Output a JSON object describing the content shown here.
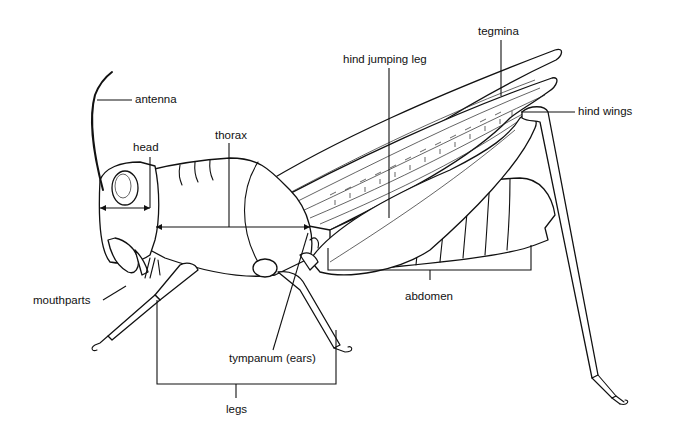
{
  "diagram": {
    "labels": {
      "antenna": "antenna",
      "head": "head",
      "thorax": "thorax",
      "hind_jumping_leg": "hind jumping leg",
      "tegmina": "tegmina",
      "hind_wings": "hind wings",
      "mouthparts": "mouthparts",
      "abdomen": "abdomen",
      "tympanum": "tympanum (ears)",
      "legs": "legs"
    },
    "colors": {
      "line": "#111111",
      "background": "#ffffff"
    }
  }
}
